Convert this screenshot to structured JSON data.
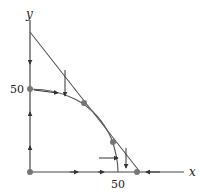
{
  "diagram": {
    "axes": {
      "x_label": "x",
      "y_label": "y",
      "x_tick_label": "50",
      "y_tick_label": "50"
    },
    "elements": [
      {
        "type": "straight-line",
        "description": "descending line from y-axis to x-axis"
      },
      {
        "type": "curve",
        "description": "concave arc from (0,50) to (50,0)"
      }
    ],
    "equilibrium_points": [
      {
        "name": "origin"
      },
      {
        "name": "y-intercept-of-curve",
        "label": "50"
      },
      {
        "name": "upper-intersection"
      },
      {
        "name": "lower-intersection"
      },
      {
        "name": "x-intercept-of-line"
      }
    ],
    "colors": {
      "line": "#555555",
      "point": "#777777",
      "arrow": "#333333"
    }
  }
}
